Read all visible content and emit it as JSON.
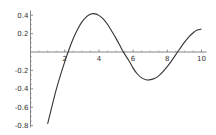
{
  "chart_data": {
    "type": "line",
    "title": "",
    "xlabel": "",
    "ylabel": "",
    "xlim": [
      1,
      10
    ],
    "ylim": [
      -0.8,
      0.45
    ],
    "grid": false,
    "legend": null,
    "x_ticks": [
      2,
      4,
      6,
      8,
      10
    ],
    "x_tick_labels": [
      "2",
      "4",
      "6",
      "8",
      "10"
    ],
    "y_ticks": [
      0.4,
      0.2,
      -0.2,
      -0.4,
      -0.6,
      -0.8
    ],
    "y_tick_labels": [
      "0.4",
      "0.2",
      "-0.2",
      "-0.4",
      "-0.6",
      "-0.8"
    ],
    "series": [
      {
        "name": "curve",
        "color": "#333333",
        "x": [
          1.0,
          1.25,
          1.5,
          1.75,
          2.0,
          2.2,
          2.5,
          2.75,
          3.0,
          3.25,
          3.5,
          3.7,
          4.0,
          4.25,
          4.5,
          4.75,
          5.0,
          5.25,
          5.43,
          5.75,
          6.0,
          6.25,
          6.5,
          6.75,
          6.94,
          7.25,
          7.5,
          7.75,
          8.0,
          8.25,
          8.6,
          8.75,
          9.0,
          9.25,
          9.5,
          9.75,
          10.0
        ],
        "y": [
          -0.781,
          -0.595,
          -0.412,
          -0.254,
          -0.107,
          0.0,
          0.146,
          0.245,
          0.325,
          0.38,
          0.41,
          0.417,
          0.398,
          0.36,
          0.301,
          0.226,
          0.148,
          0.063,
          0.0,
          -0.093,
          -0.175,
          -0.239,
          -0.281,
          -0.301,
          -0.303,
          -0.287,
          -0.259,
          -0.214,
          -0.158,
          -0.097,
          0.0,
          0.04,
          0.104,
          0.161,
          0.207,
          0.238,
          0.249
        ]
      }
    ]
  }
}
